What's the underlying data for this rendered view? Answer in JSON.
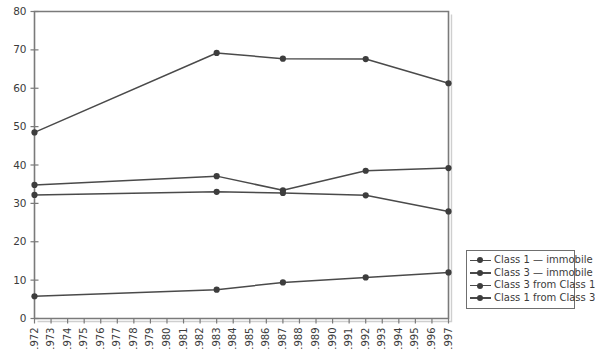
{
  "chart_data": {
    "type": "line",
    "title": "",
    "xlabel": "",
    "ylabel": "",
    "xlim": [
      1972,
      1997
    ],
    "ylim": [
      0,
      80
    ],
    "grid": false,
    "legend_position": "bottom-right",
    "ytick_labels": [
      "0",
      "10",
      "20",
      "30",
      "40",
      "50",
      "60",
      "70",
      "80"
    ],
    "yticks": [
      0,
      10,
      20,
      30,
      40,
      50,
      60,
      70,
      80
    ],
    "xtick_labels": [
      "1972",
      "1973",
      "1974",
      "1975",
      "1976",
      "1977",
      "1978",
      "1979",
      "1980",
      "1981",
      "1982",
      "1983",
      "1984",
      "1985",
      "1986",
      "1987",
      "1988",
      "1989",
      "1990",
      "1991",
      "1992",
      "1993",
      "1994",
      "1995",
      "1996",
      "1997"
    ],
    "xticks": [
      1972,
      1973,
      1974,
      1975,
      1976,
      1977,
      1978,
      1979,
      1980,
      1981,
      1982,
      1983,
      1984,
      1985,
      1986,
      1987,
      1988,
      1989,
      1990,
      1991,
      1992,
      1993,
      1994,
      1995,
      1996,
      1997
    ],
    "x": [
      1972,
      1983,
      1987,
      1992,
      1997
    ],
    "series": [
      {
        "name": "Class 1 — immobile",
        "color": "#4a4a4a",
        "values": [
          48.5,
          69.2,
          67.7,
          67.6,
          61.3
        ]
      },
      {
        "name": "Class 3 — immobile",
        "color": "#4a4a4a",
        "values": [
          34.8,
          37.1,
          33.4,
          38.5,
          39.2
        ]
      },
      {
        "name": "Class 3 from Class 1",
        "color": "#4a4a4a",
        "values": [
          32.2,
          33.0,
          32.7,
          32.1,
          27.9
        ]
      },
      {
        "name": "Class 1 from Class 3",
        "color": "#4a4a4a",
        "values": [
          5.8,
          7.5,
          9.4,
          10.7,
          12.0
        ]
      }
    ]
  },
  "legend": {
    "entries": [
      {
        "label": "Class 1 — immobile"
      },
      {
        "label": "Class 3 — immobile"
      },
      {
        "label": "Class 3 from Class 1"
      },
      {
        "label": "Class 1 from Class 3"
      }
    ]
  }
}
